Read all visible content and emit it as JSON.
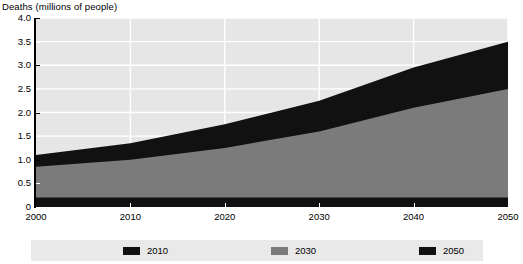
{
  "chart_data": {
    "type": "area",
    "title": "Deaths (millions of people)",
    "xlabel": "",
    "ylabel": "Deaths (millions of people)",
    "stacked": true,
    "grid": true,
    "legend_position": "bottom",
    "xlim": [
      2000,
      2050
    ],
    "ylim": [
      0,
      4.0
    ],
    "x": [
      2000,
      2010,
      2020,
      2030,
      2040,
      2050
    ],
    "x_tick_labels": [
      "2000",
      "2010",
      "2020",
      "2030",
      "2040",
      "2050"
    ],
    "y_ticks": [
      0,
      0.5,
      1.0,
      1.5,
      2.0,
      2.5,
      3.0,
      3.5,
      4.0
    ],
    "y_tick_labels": [
      "0",
      "0.5",
      "1.0",
      "1.5",
      "2.0",
      "2.5",
      "3.0",
      "3.5",
      "4.0"
    ],
    "series": [
      {
        "name": "2010",
        "color": "#111111",
        "values": [
          0.2,
          0.2,
          0.2,
          0.2,
          0.2,
          0.2
        ]
      },
      {
        "name": "2030",
        "color": "#7b7b7b",
        "values": [
          0.65,
          0.8,
          1.05,
          1.4,
          1.9,
          2.3
        ]
      },
      {
        "name": "2050",
        "color": "#111111",
        "values": [
          0.25,
          0.35,
          0.5,
          0.65,
          0.85,
          1.0
        ]
      }
    ],
    "cumulative_tops": {
      "band1": [
        0.2,
        0.2,
        0.2,
        0.2,
        0.2,
        0.2
      ],
      "band2": [
        0.85,
        1.0,
        1.25,
        1.6,
        2.1,
        2.5
      ],
      "band3": [
        1.1,
        1.35,
        1.75,
        2.25,
        2.95,
        3.5
      ]
    },
    "colors": {
      "plot_background": "#e6e6e6",
      "gridline": "#ffffff",
      "axis": "#000000",
      "legend_background": "#e9e9e9",
      "dark_band": "#111111",
      "gray_band": "#7b7b7b"
    }
  },
  "legend": {
    "items": [
      {
        "label": "2010",
        "color": "#111111"
      },
      {
        "label": "2030",
        "color": "#7b7b7b"
      },
      {
        "label": "2050",
        "color": "#111111"
      }
    ]
  }
}
